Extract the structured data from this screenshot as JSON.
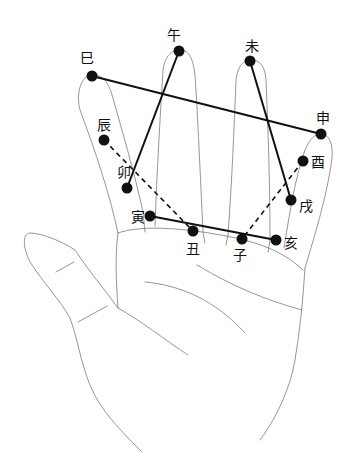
{
  "diagram": {
    "type": "palm-branch-diagram",
    "branches": [
      {
        "id": "si",
        "label": "巳",
        "dot": [
          92,
          76
        ],
        "label_pos": [
          87,
          58
        ]
      },
      {
        "id": "wu",
        "label": "午",
        "dot": [
          179,
          51
        ],
        "label_pos": [
          174,
          35
        ]
      },
      {
        "id": "wei",
        "label": "未",
        "dot": [
          250,
          61
        ],
        "label_pos": [
          252,
          46
        ]
      },
      {
        "id": "shen",
        "label": "申",
        "dot": [
          321,
          134
        ],
        "label_pos": [
          323,
          118
        ]
      },
      {
        "id": "you",
        "label": "酉",
        "dot": [
          303,
          161
        ],
        "label_pos": [
          318,
          162
        ]
      },
      {
        "id": "xu",
        "label": "戌",
        "dot": [
          291,
          200
        ],
        "label_pos": [
          306,
          206
        ]
      },
      {
        "id": "hai",
        "label": "亥",
        "dot": [
          276,
          240
        ],
        "label_pos": [
          291,
          243
        ]
      },
      {
        "id": "zi",
        "label": "子",
        "dot": [
          242,
          239
        ],
        "label_pos": [
          240,
          255
        ]
      },
      {
        "id": "chou",
        "label": "丑",
        "dot": [
          193,
          231
        ],
        "label_pos": [
          193,
          249
        ]
      },
      {
        "id": "yin",
        "label": "寅",
        "dot": [
          150,
          216
        ],
        "label_pos": [
          138,
          217
        ]
      },
      {
        "id": "mao",
        "label": "卯",
        "dot": [
          127,
          188
        ],
        "label_pos": [
          124,
          172
        ]
      },
      {
        "id": "chen",
        "label": "辰",
        "dot": [
          104,
          140
        ],
        "label_pos": [
          104,
          125
        ]
      }
    ],
    "solid_lines": [
      [
        "si",
        "shen"
      ],
      [
        "wu",
        "mao"
      ],
      [
        "wei",
        "xu"
      ],
      [
        "yin",
        "hai"
      ]
    ],
    "dashed_lines": [
      [
        "chen",
        "chou"
      ],
      [
        "you",
        "zi"
      ]
    ],
    "colors": {
      "line": "#111111",
      "dot": "#111111",
      "outline": "#888888"
    }
  }
}
